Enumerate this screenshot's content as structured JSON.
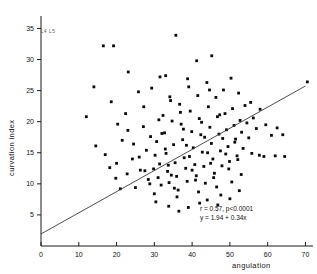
{
  "chart_data": {
    "type": "scatter",
    "title": "",
    "xlabel": "angulation",
    "ylabel": "curvation index",
    "xlim": [
      0,
      72
    ],
    "ylim": [
      0,
      37
    ],
    "grid": false,
    "legend": null,
    "xticks": [
      0,
      10,
      20,
      30,
      40,
      50,
      60,
      70
    ],
    "yticks": [
      5,
      10,
      15,
      20,
      25,
      30,
      35
    ],
    "xtick_labels": [
      "0",
      "10",
      "20",
      "30",
      "40",
      "50",
      "60",
      "70"
    ],
    "ytick_labels": [
      "5",
      "10",
      "15",
      "20",
      "25",
      "30",
      "35"
    ],
    "annotations": [
      "r = 0.57, p<0.0001",
      "y = 1.94 + 0.34x"
    ],
    "corner_note": "L4 L5",
    "fit": {
      "type": "line",
      "intercept": 1.94,
      "slope": 0.34,
      "r": 0.57,
      "p": "<0.0001",
      "x_start": 0,
      "x_end": 70
    },
    "points": [
      [
        16.5,
        32.2
      ],
      [
        19.2,
        32.2
      ],
      [
        29.8,
        12.4
      ],
      [
        30.2,
        14.6
      ],
      [
        30.6,
        16.8
      ],
      [
        31.0,
        11.0
      ],
      [
        31.4,
        13.2
      ],
      [
        31.8,
        9.8
      ],
      [
        20.0,
        13.3
      ],
      [
        21.5,
        17.0
      ],
      [
        22.8,
        11.6
      ],
      [
        24.2,
        14.0
      ],
      [
        25.0,
        9.4
      ],
      [
        26.3,
        12.2
      ],
      [
        27.1,
        19.2
      ],
      [
        27.9,
        15.4
      ],
      [
        28.4,
        10.7
      ],
      [
        29.0,
        17.6
      ],
      [
        32.3,
        21.0
      ],
      [
        32.7,
        18.2
      ],
      [
        33.1,
        14.9
      ],
      [
        33.5,
        12.0
      ],
      [
        33.9,
        10.2
      ],
      [
        34.3,
        23.4
      ],
      [
        34.7,
        20.1
      ],
      [
        35.1,
        16.3
      ],
      [
        35.5,
        13.4
      ],
      [
        35.9,
        11.2
      ],
      [
        36.3,
        9.0
      ],
      [
        36.7,
        22.8
      ],
      [
        37.1,
        19.6
      ],
      [
        37.5,
        17.1
      ],
      [
        37.9,
        14.2
      ],
      [
        38.3,
        12.5
      ],
      [
        38.7,
        10.4
      ],
      [
        39.1,
        25.6
      ],
      [
        39.5,
        21.7
      ],
      [
        39.9,
        18.4
      ],
      [
        40.3,
        15.8
      ],
      [
        40.7,
        13.1
      ],
      [
        41.1,
        11.3
      ],
      [
        41.5,
        24.2
      ],
      [
        41.9,
        20.5
      ],
      [
        42.3,
        17.9
      ],
      [
        42.7,
        15.1
      ],
      [
        43.1,
        12.8
      ],
      [
        43.5,
        10.1
      ],
      [
        43.9,
        26.3
      ],
      [
        44.3,
        22.4
      ],
      [
        44.7,
        19.1
      ],
      [
        45.1,
        16.5
      ],
      [
        45.5,
        14.0
      ],
      [
        45.9,
        11.7
      ],
      [
        46.3,
        23.9
      ],
      [
        46.7,
        20.8
      ],
      [
        47.1,
        18.0
      ],
      [
        47.5,
        15.3
      ],
      [
        47.9,
        12.9
      ],
      [
        48.3,
        25.1
      ],
      [
        48.7,
        21.3
      ],
      [
        49.1,
        18.7
      ],
      [
        49.5,
        16.0
      ],
      [
        49.9,
        13.6
      ],
      [
        50.3,
        27.0
      ],
      [
        50.7,
        22.1
      ],
      [
        51.1,
        19.4
      ],
      [
        51.5,
        17.2
      ],
      [
        51.9,
        14.5
      ],
      [
        52.3,
        24.6
      ],
      [
        52.7,
        20.2
      ],
      [
        53.1,
        18.3
      ],
      [
        53.5,
        15.7
      ],
      [
        54.0,
        22.6
      ],
      [
        54.5,
        19.8
      ],
      [
        55.0,
        17.4
      ],
      [
        55.5,
        23.1
      ],
      [
        56.2,
        20.6
      ],
      [
        57.0,
        18.9
      ],
      [
        58.0,
        22.0
      ],
      [
        59.5,
        19.5
      ],
      [
        61.0,
        17.8
      ],
      [
        62.5,
        19.0
      ],
      [
        64.0,
        17.9
      ],
      [
        70.5,
        26.4
      ],
      [
        12.0,
        20.8
      ],
      [
        14.5,
        16.1
      ],
      [
        17.0,
        14.7
      ],
      [
        18.2,
        12.6
      ],
      [
        19.8,
        10.9
      ],
      [
        21.0,
        9.2
      ],
      [
        23.0,
        18.6
      ],
      [
        24.5,
        16.4
      ],
      [
        26.0,
        14.3
      ],
      [
        27.5,
        12.1
      ],
      [
        28.8,
        10.0
      ],
      [
        30.0,
        8.4
      ],
      [
        31.2,
        20.3
      ],
      [
        32.0,
        18.1
      ],
      [
        32.9,
        15.6
      ],
      [
        33.7,
        13.0
      ],
      [
        34.5,
        11.4
      ],
      [
        35.3,
        9.3
      ],
      [
        36.0,
        7.9
      ],
      [
        36.9,
        21.5
      ],
      [
        37.7,
        18.8
      ],
      [
        38.5,
        16.2
      ],
      [
        39.3,
        14.4
      ],
      [
        40.0,
        12.2
      ],
      [
        40.9,
        10.6
      ],
      [
        41.7,
        8.7
      ],
      [
        42.5,
        19.9
      ],
      [
        43.3,
        17.5
      ],
      [
        44.1,
        15.0
      ],
      [
        44.9,
        13.3
      ],
      [
        45.7,
        11.0
      ],
      [
        46.5,
        9.5
      ],
      [
        47.3,
        21.1
      ],
      [
        48.1,
        17.3
      ],
      [
        48.9,
        14.8
      ],
      [
        49.7,
        12.4
      ],
      [
        50.5,
        10.3
      ],
      [
        51.3,
        16.7
      ],
      [
        52.1,
        13.9
      ],
      [
        53.0,
        11.5
      ],
      [
        35.7,
        33.9
      ],
      [
        41.2,
        29.8
      ],
      [
        45.2,
        30.6
      ],
      [
        23.1,
        28.0
      ],
      [
        31.5,
        27.2
      ],
      [
        33.0,
        27.4
      ],
      [
        38.8,
        26.9
      ],
      [
        44.6,
        25.1
      ],
      [
        14.0,
        25.6
      ],
      [
        18.6,
        23.2
      ],
      [
        25.8,
        24.8
      ],
      [
        29.3,
        25.4
      ],
      [
        34.1,
        24.0
      ],
      [
        27.2,
        22.4
      ],
      [
        22.4,
        21.3
      ],
      [
        20.3,
        19.6
      ],
      [
        57.8,
        14.6
      ],
      [
        59.0,
        14.4
      ],
      [
        62.0,
        14.5
      ],
      [
        64.5,
        14.4
      ],
      [
        55.8,
        14.9
      ],
      [
        42.0,
        6.9
      ],
      [
        44.0,
        7.4
      ],
      [
        46.8,
        6.6
      ],
      [
        39.0,
        6.2
      ],
      [
        36.5,
        5.6
      ],
      [
        33.8,
        6.4
      ],
      [
        30.4,
        7.1
      ],
      [
        47.6,
        8.2
      ],
      [
        50.0,
        7.6
      ],
      [
        52.5,
        8.9
      ]
    ]
  }
}
